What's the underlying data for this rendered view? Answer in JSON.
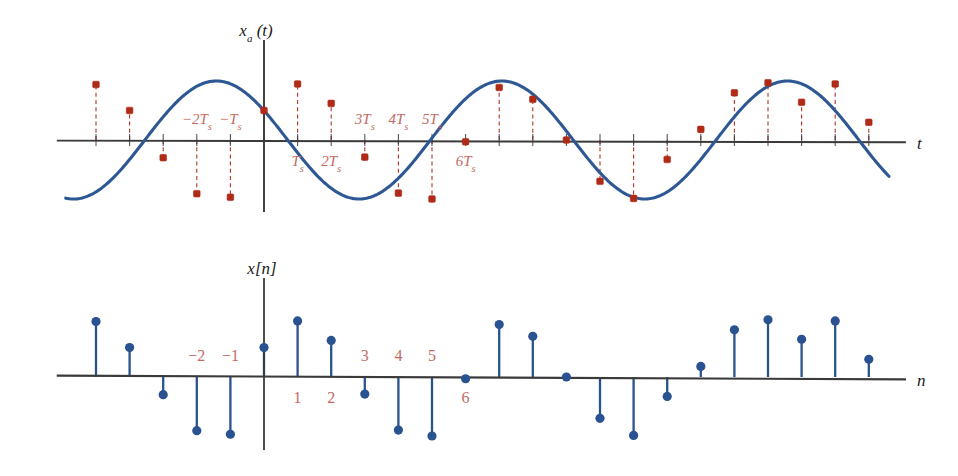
{
  "figure": {
    "background_color": "#ffffff",
    "axis_color": "#3a3a3a",
    "curve_color": "#2e5894",
    "sample_color": "#b02a18",
    "stem_color": "#2a5190",
    "tick_label_color": "#c46a63"
  },
  "chart_data": [
    {
      "type": "line",
      "id": "continuous-signal",
      "title": "",
      "ylabel": "x_a (t)",
      "xlabel": "t",
      "ylabel_display": "xa(t)",
      "grid": false,
      "legend": null,
      "axis_origin_index": 0,
      "sample_period_label": "Ts",
      "xlim": [
        -5.9,
        18.6
      ],
      "ylim": [
        -1.35,
        1.35
      ],
      "x_tick_labels": [
        "-2Ts",
        "-Ts",
        "Ts",
        "2Ts",
        "3Ts",
        "4Ts",
        "5Ts",
        "6Ts"
      ],
      "x_tick_indices": [
        -2,
        -1,
        1,
        2,
        3,
        4,
        5,
        6
      ],
      "x_tick_label_above": [
        true,
        true,
        false,
        false,
        true,
        true,
        true,
        false
      ],
      "sample_indices": [
        -5,
        -4,
        -3,
        -2,
        -1,
        0,
        1,
        2,
        3,
        4,
        5,
        6,
        7,
        8,
        9,
        10,
        11,
        12,
        13,
        14,
        15,
        16,
        17,
        18
      ],
      "sample_values": [
        0.94,
        0.5,
        -0.3,
        -0.91,
        -0.97,
        0.5,
        0.95,
        0.62,
        -0.29,
        -0.9,
        -1.0,
        -0.03,
        0.89,
        0.69,
        0.0,
        -0.7,
        -0.99,
        -0.33,
        0.18,
        0.8,
        0.97,
        0.64,
        0.95,
        0.3
      ],
      "curve_expression": "x_a(t) = cos(2*pi*t/8.5 + 1.05)",
      "n_points": 600
    },
    {
      "type": "stem",
      "id": "discrete-sequence",
      "title": "",
      "ylabel": "x[n]",
      "xlabel": "n",
      "grid": false,
      "legend": null,
      "xlim": [
        -5.9,
        18.6
      ],
      "ylim": [
        -1.35,
        1.35
      ],
      "x_tick_labels": [
        "-2",
        "-1",
        "1",
        "2",
        "3",
        "4",
        "5",
        "6"
      ],
      "x_tick_indices": [
        -2,
        -1,
        1,
        2,
        3,
        4,
        5,
        6
      ],
      "x_tick_label_above": [
        true,
        true,
        false,
        false,
        true,
        true,
        true,
        false
      ],
      "categories": [
        -5,
        -4,
        -3,
        -2,
        -1,
        0,
        1,
        2,
        3,
        4,
        5,
        6,
        7,
        8,
        9,
        10,
        11,
        12,
        13,
        14,
        15,
        16,
        17,
        18
      ],
      "values": [
        0.94,
        0.5,
        -0.3,
        -0.91,
        -0.97,
        0.5,
        0.95,
        0.62,
        -0.29,
        -0.9,
        -1.0,
        -0.03,
        0.89,
        0.69,
        0.0,
        -0.7,
        -0.99,
        -0.33,
        0.18,
        0.8,
        0.97,
        0.64,
        0.95,
        0.3
      ]
    }
  ],
  "labels": {
    "top_y_axis": "xa (t)",
    "top_y_axis_main": "x",
    "top_y_axis_sub": "a",
    "top_y_axis_tail": "(t)",
    "top_x_axis": "t",
    "bottom_y_axis": "x[n]",
    "bottom_x_axis": "n"
  }
}
